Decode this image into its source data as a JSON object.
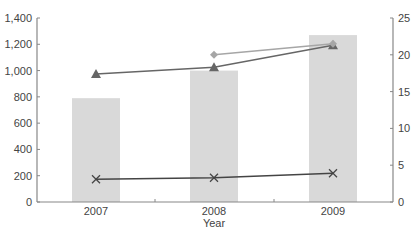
{
  "chart_data": {
    "type": "bar",
    "title": "",
    "xlabel": "Year",
    "ylabel": "",
    "y2label": "",
    "categories": [
      "2007",
      "2008",
      "2009"
    ],
    "ylim": [
      0,
      1400
    ],
    "y2lim": [
      0,
      25
    ],
    "yticks": [
      "0",
      "200",
      "400",
      "600",
      "800",
      "1,000",
      "1,200",
      "1,400"
    ],
    "y2ticks": [
      "0",
      "5",
      "10",
      "15",
      "20",
      "25"
    ],
    "grid": false,
    "legend": null,
    "series": [
      {
        "name": "Bars (left axis)",
        "kind": "bar",
        "axis": "left",
        "color": "#d9d9d9",
        "marker": "none",
        "values": [
          790,
          1000,
          1270
        ]
      },
      {
        "name": "Triangle series (right axis)",
        "kind": "line",
        "axis": "right",
        "color": "#666666",
        "marker": "triangle",
        "values": [
          17.4,
          18.3,
          21.3
        ]
      },
      {
        "name": "Diamond series (right axis)",
        "kind": "line",
        "axis": "right",
        "color": "#a6a6a6",
        "marker": "diamond",
        "values": [
          null,
          20.0,
          21.5
        ]
      },
      {
        "name": "Cross series (right axis)",
        "kind": "line",
        "axis": "right",
        "color": "#444444",
        "marker": "x",
        "values": [
          3.1,
          3.3,
          3.9
        ]
      }
    ]
  }
}
